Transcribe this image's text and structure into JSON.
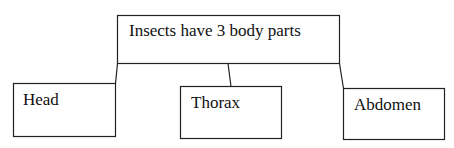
{
  "diagram": {
    "root": {
      "label": "Insects have 3 body parts"
    },
    "children": [
      {
        "label": "Head"
      },
      {
        "label": "Thorax"
      },
      {
        "label": "Abdomen"
      }
    ],
    "colors": {
      "stroke": "#222222",
      "background": "#ffffff",
      "text": "#111111"
    }
  }
}
